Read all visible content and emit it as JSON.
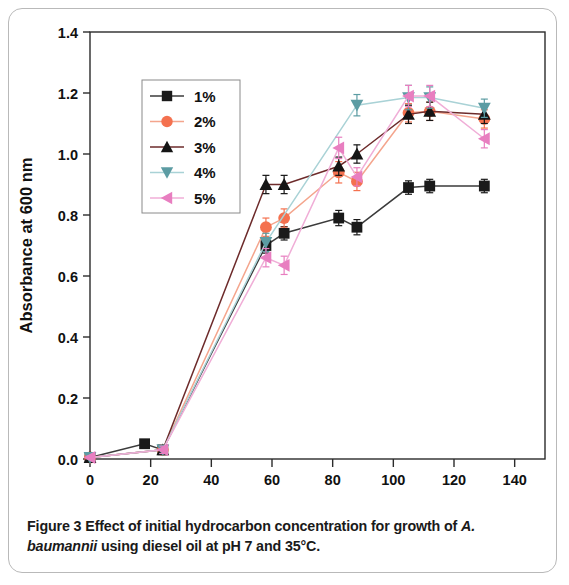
{
  "figure": {
    "caption_label": "Figure 3",
    "caption_text": " Effect of initial hydrocarbon concentration for growth of ",
    "caption_italic": "A. baumannii",
    "caption_text2": " using diesel oil at pH 7 and 35°C."
  },
  "chart_data": {
    "type": "line",
    "title": "",
    "xlabel": "Time (h)",
    "ylabel": "Absorbance at 600 nm",
    "xlim": [
      0,
      150
    ],
    "ylim": [
      0.0,
      1.4
    ],
    "xticks": [
      0,
      20,
      40,
      60,
      80,
      100,
      120,
      140
    ],
    "xtick_labels": [
      "0",
      "20",
      "40",
      "60",
      "80",
      "100",
      "120",
      "140"
    ],
    "yticks": [
      0.0,
      0.2,
      0.4,
      0.6,
      0.8,
      1.0,
      1.2,
      1.4
    ],
    "ytick_labels": [
      "0.0",
      "0.2",
      "0.4",
      "0.6",
      "0.8",
      "1.0",
      "1.2",
      "1.4"
    ],
    "grid": false,
    "legend_position": "upper left",
    "error_bars": true,
    "series": [
      {
        "name": "1%",
        "color": "#1a1a1a",
        "line_color": "#3b3b3b",
        "marker": "square",
        "x": [
          0,
          18,
          24,
          58,
          64,
          82,
          88,
          105,
          112,
          130
        ],
        "y": [
          0.005,
          0.05,
          0.03,
          0.7,
          0.74,
          0.79,
          0.76,
          0.89,
          0.895,
          0.895
        ],
        "yerr": [
          0.005,
          0.012,
          0.012,
          0.025,
          0.022,
          0.025,
          0.025,
          0.022,
          0.022,
          0.022
        ]
      },
      {
        "name": "2%",
        "color": "#f4714f",
        "line_color": "#f4a58d",
        "marker": "circle",
        "x": [
          0,
          24,
          58,
          64,
          82,
          88,
          105,
          112,
          130
        ],
        "y": [
          0.005,
          0.03,
          0.76,
          0.79,
          0.94,
          0.91,
          1.135,
          1.14,
          1.115
        ],
        "yerr": [
          0.005,
          0.012,
          0.03,
          0.03,
          0.035,
          0.03,
          0.03,
          0.03,
          0.03
        ]
      },
      {
        "name": "3%",
        "color": "#151515",
        "line_color": "#6d2b2b",
        "marker": "triangle-up",
        "x": [
          0,
          24,
          58,
          64,
          82,
          88,
          105,
          112,
          130
        ],
        "y": [
          0.005,
          0.03,
          0.9,
          0.9,
          0.96,
          1.0,
          1.13,
          1.14,
          1.13
        ],
        "yerr": [
          0.005,
          0.012,
          0.03,
          0.03,
          0.03,
          0.03,
          0.03,
          0.03,
          0.03
        ]
      },
      {
        "name": "4%",
        "color": "#5c9ca3",
        "line_color": "#a9d2d6",
        "marker": "triangle-down",
        "x": [
          0,
          24,
          58,
          88,
          105,
          112,
          130
        ],
        "y": [
          0.005,
          0.03,
          0.71,
          1.16,
          1.185,
          1.185,
          1.15
        ],
        "yerr": [
          0.005,
          0.012,
          0.03,
          0.035,
          0.04,
          0.035,
          0.03
        ]
      },
      {
        "name": "5%",
        "color": "#e87ec0",
        "line_color": "#f0aed7",
        "marker": "triangle-left",
        "x": [
          0,
          24,
          58,
          64,
          82,
          88,
          105,
          112,
          130
        ],
        "y": [
          0.005,
          0.03,
          0.66,
          0.635,
          1.02,
          0.925,
          1.19,
          1.19,
          1.05
        ],
        "yerr": [
          0.005,
          0.012,
          0.03,
          0.03,
          0.035,
          0.03,
          0.035,
          0.035,
          0.03
        ]
      }
    ]
  }
}
